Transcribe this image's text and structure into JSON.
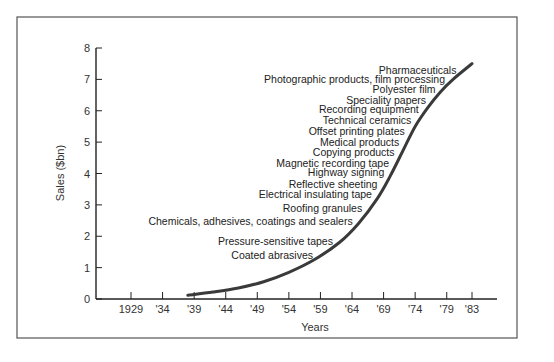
{
  "chart_data": {
    "type": "line",
    "title": "",
    "xlabel": "Years",
    "ylabel": "Sales ($bn)",
    "xlim": [
      1924,
      1987
    ],
    "ylim": [
      0,
      8
    ],
    "grid": false,
    "legend": "none",
    "x_ticks": [
      {
        "value": 1929,
        "label": "1929"
      },
      {
        "value": 1934,
        "label": "'34"
      },
      {
        "value": 1939,
        "label": "'39"
      },
      {
        "value": 1944,
        "label": "'44"
      },
      {
        "value": 1949,
        "label": "'49"
      },
      {
        "value": 1954,
        "label": "'54"
      },
      {
        "value": 1959,
        "label": "'59"
      },
      {
        "value": 1964,
        "label": "'64"
      },
      {
        "value": 1969,
        "label": "'69"
      },
      {
        "value": 1974,
        "label": "'74"
      },
      {
        "value": 1979,
        "label": "'79"
      },
      {
        "value": 1983,
        "label": "'83"
      }
    ],
    "y_ticks": [
      {
        "value": 0,
        "label": "0"
      },
      {
        "value": 1,
        "label": "1"
      },
      {
        "value": 2,
        "label": "2"
      },
      {
        "value": 3,
        "label": "3"
      },
      {
        "value": 4,
        "label": "4"
      },
      {
        "value": 5,
        "label": "5"
      },
      {
        "value": 6,
        "label": "6"
      },
      {
        "value": 7,
        "label": "7"
      },
      {
        "value": 8,
        "label": "8"
      }
    ],
    "series": [
      {
        "name": "3M sales",
        "color": "#3a3a3a",
        "x": [
          1938,
          1942,
          1946,
          1950,
          1954,
          1958,
          1962,
          1965,
          1968,
          1970,
          1972,
          1974,
          1976,
          1978,
          1980,
          1983
        ],
        "y": [
          0.12,
          0.22,
          0.35,
          0.55,
          0.85,
          1.25,
          1.8,
          2.4,
          3.2,
          3.9,
          4.7,
          5.5,
          6.1,
          6.6,
          7.0,
          7.5
        ]
      }
    ],
    "annotations": [
      {
        "text": "Pharmaceuticals",
        "y": 7.3
      },
      {
        "text": "Photographic products, film processing",
        "y": 7.0
      },
      {
        "text": "Polyester film",
        "y": 6.7
      },
      {
        "text": "Speciality papers",
        "y": 6.35
      },
      {
        "text": "Recording equipment",
        "y": 6.05
      },
      {
        "text": "Technical ceramics",
        "y": 5.7
      },
      {
        "text": "Offset printing plates",
        "y": 5.35
      },
      {
        "text": "Medical products",
        "y": 5.0
      },
      {
        "text": "Copying products",
        "y": 4.7
      },
      {
        "text": "Magnetic recording tape",
        "y": 4.35
      },
      {
        "text": "Highway signing",
        "y": 4.05
      },
      {
        "text": "Reflective sheeting",
        "y": 3.65
      },
      {
        "text": "Electrical insulating tape",
        "y": 3.35
      },
      {
        "text": "Roofing granules",
        "y": 2.9
      },
      {
        "text": "Chemicals, adhesives, coatings and sealers",
        "y": 2.5
      },
      {
        "text": "Pressure-sensitive tapes",
        "y": 1.85
      },
      {
        "text": "Coated abrasives",
        "y": 1.4
      }
    ]
  }
}
